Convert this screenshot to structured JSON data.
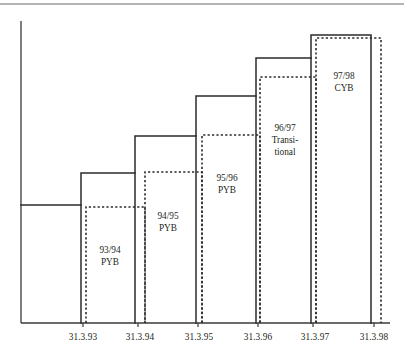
{
  "chart_data": {
    "type": "bar",
    "title": "",
    "subtitle": "",
    "xlabel": "",
    "ylabel": "",
    "grid": false,
    "legend": "none",
    "annotation_note": "Staircase of solid outlined step bars (budget years) each overlaid by an offset dashed outline bar; labels sit inside each bar.",
    "categories": [
      "31.3.93",
      "31.3.94",
      "31.3.95",
      "31.3.96",
      "31.3.97",
      "31.3.98"
    ],
    "x_tick_labels": [
      "31.3.93",
      "31.3.94",
      "31.3.95",
      "31.3.96",
      "31.3.97",
      "31.3.98"
    ],
    "series": [
      {
        "name": "solid-step-outline",
        "style": "solid",
        "values": [
          24,
          32,
          41,
          51,
          60,
          66
        ]
      },
      {
        "name": "dashed-offset-outline",
        "style": "dashed",
        "values": [
          23,
          32,
          41,
          51,
          60,
          65
        ]
      }
    ],
    "bar_labels": [
      {
        "id": "bar-93-94",
        "lines": [
          "93/94",
          "PYB"
        ]
      },
      {
        "id": "bar-94-95",
        "lines": [
          "94/95",
          "PYB"
        ]
      },
      {
        "id": "bar-95-96",
        "lines": [
          "95/96",
          "PYB"
        ]
      },
      {
        "id": "bar-96-97",
        "lines": [
          "96/97",
          "Transi-",
          "tional"
        ]
      },
      {
        "id": "bar-97-98",
        "lines": [
          "97/98",
          "CYB"
        ]
      }
    ],
    "geometry": {
      "baseline_y": 323,
      "axis_x": 21,
      "axis_top_y": 21,
      "axis_right_x": 390,
      "top_rule_y": 4,
      "solid_boundaries_x": [
        21,
        81,
        135,
        196,
        256,
        311,
        371
      ],
      "solid_tops_y": [
        205,
        173,
        136,
        96,
        58,
        35
      ],
      "dashed_left_x": [
        86,
        145,
        202,
        260,
        316
      ],
      "dashed_right_x": [
        145,
        202,
        260,
        316,
        381
      ],
      "dashed_tops_y": [
        207,
        172,
        135,
        77,
        38
      ],
      "tick_x": [
        83,
        138,
        198,
        258,
        313,
        374
      ],
      "label_y": 340,
      "label_positions": [
        {
          "x": 83,
          "y": 340
        },
        {
          "x": 140,
          "y": 340
        },
        {
          "x": 199,
          "y": 340
        },
        {
          "x": 258,
          "y": 340
        },
        {
          "x": 315,
          "y": 340
        },
        {
          "x": 374,
          "y": 340
        }
      ],
      "bar_label_positions": [
        {
          "x": 110,
          "y": 253
        },
        {
          "x": 168,
          "y": 219
        },
        {
          "x": 227,
          "y": 181
        },
        {
          "x": 285,
          "y": 131
        },
        {
          "x": 344,
          "y": 79
        }
      ]
    }
  },
  "colors": {
    "ink": "#231f20",
    "stroke": "#2b2b2b",
    "axis": "#3a3a3a",
    "rule": "#6b6b6b",
    "background": "#ffffff"
  }
}
